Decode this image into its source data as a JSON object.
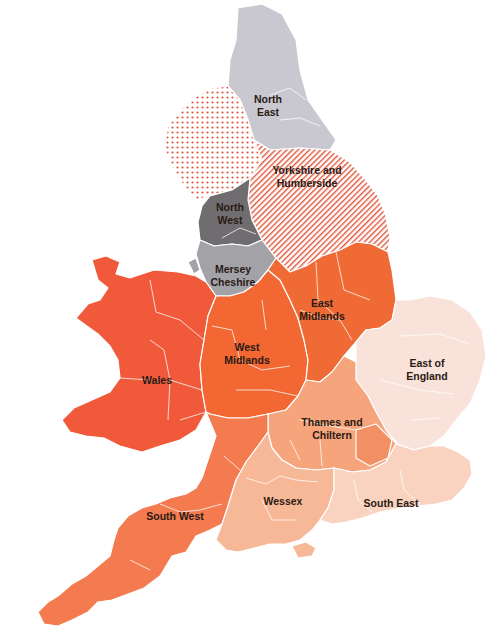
{
  "map": {
    "title": "",
    "regions": [
      {
        "id": "north-east",
        "lines": [
          "North",
          "East"
        ],
        "fill": "#c9c8d0",
        "pattern": "solid"
      },
      {
        "id": "cumbria",
        "lines": [],
        "fill": "#e2553a",
        "pattern": "dots"
      },
      {
        "id": "yorkshire-and-humberside",
        "lines": [
          "Yorkshire and",
          "Humberside"
        ],
        "fill": "#e2553a",
        "pattern": "stripes"
      },
      {
        "id": "north-west",
        "lines": [
          "North",
          "West"
        ],
        "fill": "#6f6d70",
        "pattern": "solid"
      },
      {
        "id": "mersey-cheshire",
        "lines": [
          "Mersey",
          "Cheshire"
        ],
        "fill": "#a3a2a7",
        "pattern": "solid"
      },
      {
        "id": "east-midlands",
        "lines": [
          "East",
          "Midlands"
        ],
        "fill": "#f06a35",
        "pattern": "solid"
      },
      {
        "id": "west-midlands",
        "lines": [
          "West",
          "Midlands"
        ],
        "fill": "#f26732",
        "pattern": "solid"
      },
      {
        "id": "wales",
        "lines": [
          "Wales"
        ],
        "fill": "#f05a3b",
        "pattern": "solid"
      },
      {
        "id": "east-of-england",
        "lines": [
          "East of",
          "England"
        ],
        "fill": "#f9e2d9",
        "pattern": "solid"
      },
      {
        "id": "thames-and-chiltern",
        "lines": [
          "Thames and",
          "Chiltern"
        ],
        "fill": "#f5a47c",
        "pattern": "solid"
      },
      {
        "id": "wessex",
        "lines": [
          "Wessex"
        ],
        "fill": "#f7b897",
        "pattern": "solid"
      },
      {
        "id": "south-east",
        "lines": [
          "South East"
        ],
        "fill": "#f9d3c0",
        "pattern": "solid"
      },
      {
        "id": "south-west",
        "lines": [
          "South West"
        ],
        "fill": "#f37b4f",
        "pattern": "solid"
      }
    ]
  },
  "labels": {
    "north_east": [
      "North",
      "East"
    ],
    "yorkshire": [
      "Yorkshire and",
      "Humberside"
    ],
    "north_west": [
      "North",
      "West"
    ],
    "mersey": [
      "Mersey",
      "Cheshire"
    ],
    "east_midlands": [
      "East",
      "Midlands"
    ],
    "west_midlands": [
      "West",
      "Midlands"
    ],
    "wales": [
      "Wales"
    ],
    "east_of_england": [
      "East of",
      "England"
    ],
    "thames": [
      "Thames and",
      "Chiltern"
    ],
    "wessex": [
      "Wessex"
    ],
    "south_east": [
      "South East"
    ],
    "south_west": [
      "South West"
    ]
  },
  "colors": {
    "north_east": "#c9c8d0",
    "dots": "#e2553a",
    "stripes": "#e2553a",
    "north_west": "#6f6d70",
    "mersey": "#a3a2a7",
    "east_midlands": "#f06a35",
    "west_midlands": "#f26732",
    "wales": "#f05a3b",
    "east_of_england": "#f9e2d9",
    "thames": "#f5a47c",
    "wessex": "#f7b897",
    "south_east": "#f9d3c0",
    "south_west": "#f37b4f"
  }
}
